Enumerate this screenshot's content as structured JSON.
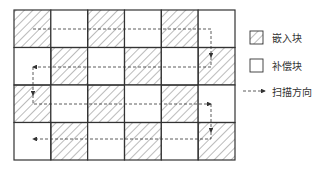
{
  "diagram": {
    "grid": {
      "rows": 4,
      "cols": 6,
      "x": 14,
      "y": 10,
      "width": 221,
      "height": 150,
      "cells": [
        [
          "embed",
          "comp",
          "embed",
          "comp",
          "embed",
          "comp"
        ],
        [
          "comp",
          "embed",
          "comp",
          "embed",
          "comp",
          "embed"
        ],
        [
          "embed",
          "comp",
          "embed",
          "comp",
          "embed",
          "comp"
        ],
        [
          "comp",
          "embed",
          "comp",
          "embed",
          "comp",
          "embed"
        ]
      ]
    },
    "scan_path": "serpentine: row0 left→right, down, row1 right→left, down, row2 left→right, down, row3 right→left",
    "legend": {
      "embed_label": "嵌入块",
      "comp_label": "补偿块",
      "scan_label": "扫描方向"
    },
    "colors": {
      "line": "#333333",
      "hatch": "#555555",
      "background": "#ffffff"
    }
  }
}
